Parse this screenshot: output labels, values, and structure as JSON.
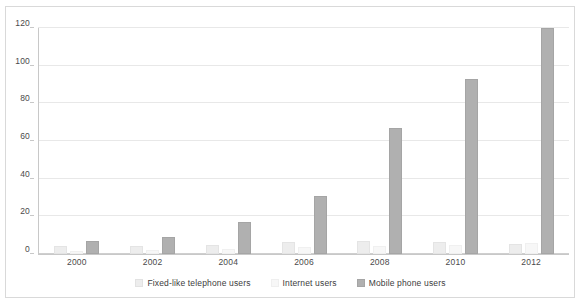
{
  "chart_data": {
    "type": "bar",
    "title": "",
    "xlabel": "",
    "ylabel": "",
    "categories": [
      "2000",
      "2002",
      "2004",
      "2006",
      "2008",
      "2010",
      "2012"
    ],
    "tick_labels": [
      "2000",
      "2002",
      "2004",
      "2006",
      "2008",
      "2010",
      "2012"
    ],
    "ylim": [
      0,
      120
    ],
    "yticks": [
      0,
      20,
      40,
      60,
      80,
      100,
      120
    ],
    "ytick_labels": [
      "0",
      "20",
      "40",
      "60",
      "80",
      "100",
      "120"
    ],
    "grid": true,
    "legend_position": "bottom",
    "series": [
      {
        "name": "Fixed-like telephone users",
        "color": "#ededed",
        "values": [
          4.5,
          4.5,
          4.7,
          6.5,
          6.8,
          6.5,
          5.5
        ]
      },
      {
        "name": "Internet users",
        "color": "#f7f7f7",
        "values": [
          1.5,
          2.0,
          2.8,
          3.5,
          4.5,
          5.0,
          5.8
        ]
      },
      {
        "name": "Mobile phone users",
        "color": "#b0b0b0",
        "values": [
          6.7,
          9.2,
          17.2,
          31.0,
          67.0,
          93.0,
          120.0
        ]
      }
    ]
  },
  "legend": {
    "items": [
      {
        "label": "Fixed-like telephone users"
      },
      {
        "label": "Internet users"
      },
      {
        "label": "Mobile phone users"
      }
    ]
  }
}
